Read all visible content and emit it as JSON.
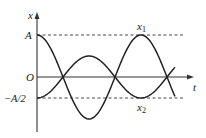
{
  "diagram": {
    "type": "oscillation-graph",
    "axes": {
      "x_label": "t",
      "y_label": "x",
      "origin_label": "O"
    },
    "levels": {
      "upper_label": "A",
      "lower_label": "−A/2"
    },
    "curves": [
      {
        "name": "x1",
        "label_main": "x",
        "label_sub": "1",
        "description": "cosine, amplitude A, starts at A"
      },
      {
        "name": "x2",
        "label_main": "x",
        "label_sub": "2",
        "description": "inverted cosine, amplitude A/2, starts at −A/2"
      }
    ],
    "colors": {
      "ink": "#222222",
      "background": "#ffffff"
    }
  }
}
